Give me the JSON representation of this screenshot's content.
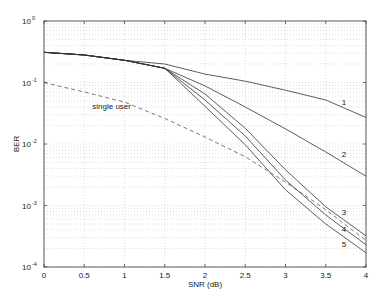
{
  "chart_data": {
    "type": "line",
    "title": "",
    "xlabel": "SNR (dB)",
    "ylabel": "BER",
    "xlim": [
      0,
      4
    ],
    "ylim": [
      0.0001,
      1
    ],
    "yscale": "log",
    "grid": true,
    "legend": "none (curves labeled inline)",
    "x": [
      0,
      0.5,
      1,
      1.5,
      2,
      2.5,
      3,
      3.5,
      4
    ],
    "x_ticks": [
      "0",
      "0.5",
      "1",
      "1.5",
      "2",
      "2.5",
      "3",
      "3.5",
      "4"
    ],
    "y_ticks": [
      {
        "base": "10",
        "exp": "0",
        "value": 1
      },
      {
        "base": "10",
        "exp": "-1",
        "value": 0.1
      },
      {
        "base": "10",
        "exp": "-2",
        "value": 0.01
      },
      {
        "base": "10",
        "exp": "-3",
        "value": 0.001
      },
      {
        "base": "10",
        "exp": "-4",
        "value": 0.0001
      }
    ],
    "series": [
      {
        "name": "1",
        "style": "solid",
        "label_at": [
          3.7,
          0.048
        ],
        "values": [
          0.31,
          0.28,
          0.23,
          0.2,
          0.137,
          0.105,
          0.075,
          0.052,
          0.027
        ]
      },
      {
        "name": "2",
        "style": "solid",
        "label_at": [
          3.7,
          0.0068
        ],
        "values": [
          0.31,
          0.28,
          0.23,
          0.17,
          0.088,
          0.04,
          0.0176,
          0.0074,
          0.003
        ]
      },
      {
        "name": "3",
        "style": "solid",
        "label_at": [
          3.7,
          0.00078
        ],
        "values": [
          0.31,
          0.28,
          0.23,
          0.17,
          0.065,
          0.018,
          0.0038,
          0.00095,
          0.00032
        ]
      },
      {
        "name": "4",
        "style": "solid",
        "label_at": [
          3.7,
          0.00042
        ],
        "values": [
          0.31,
          0.28,
          0.23,
          0.17,
          0.052,
          0.0135,
          0.0026,
          0.0007,
          0.00023
        ]
      },
      {
        "name": "5",
        "style": "solid",
        "label_at": [
          3.7,
          0.00024
        ],
        "values": [
          0.31,
          0.28,
          0.23,
          0.17,
          0.041,
          0.0097,
          0.0018,
          0.0005,
          0.00017
        ]
      },
      {
        "name": "single user",
        "style": "dashed",
        "label_at": [
          0.6,
          0.042
        ],
        "values": [
          0.1,
          0.07,
          0.048,
          0.026,
          0.013,
          0.0062,
          0.0024,
          0.00085,
          0.00027
        ]
      }
    ]
  }
}
